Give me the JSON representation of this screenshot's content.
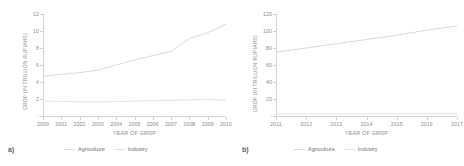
{
  "figure": {
    "panels": [
      {
        "tag": "a)",
        "ylabel": "GRDP (IN TRILLION RUPIAHS)",
        "xlabel": "YEAR OF GRDP",
        "ytick_labels": [
          "12",
          "10",
          "8",
          "6",
          "4",
          "2",
          "-"
        ],
        "xtick_labels": [
          "2000",
          "2001",
          "2002",
          "2003",
          "2004",
          "2005",
          "2006",
          "2007",
          "2008",
          "2009",
          "2010"
        ],
        "legend": [
          {
            "label": "Agriculture",
            "color": "#d9d9d9"
          },
          {
            "label": "Industry",
            "color": "#e3e3e3"
          }
        ]
      },
      {
        "tag": "b)",
        "ylabel": "GRDP (IN TRILLION RUPIAHS)",
        "xlabel": "YEAR OF GRDP",
        "ytick_labels": [
          "120",
          "100",
          "80",
          "60",
          "40",
          "20",
          "-"
        ],
        "xtick_labels": [
          "2011",
          "2012",
          "2013",
          "2014",
          "2015",
          "2016",
          "2017"
        ],
        "legend": [
          {
            "label": "Agriculture",
            "color": "#d9d9d9"
          },
          {
            "label": "Industry",
            "color": "#e3e3e3"
          }
        ]
      }
    ]
  },
  "chart_data": [
    {
      "type": "line",
      "title": "",
      "panel_tag": "a)",
      "xlabel": "YEAR OF GRDP",
      "ylabel": "GRDP (IN TRILLION RUPIAHS)",
      "x": [
        2000,
        2001,
        2002,
        2003,
        2004,
        2005,
        2006,
        2007,
        2008,
        2009,
        2010
      ],
      "xlim": [
        2000,
        2010
      ],
      "ylim": [
        0,
        12
      ],
      "yticks": [
        0,
        2,
        4,
        6,
        8,
        10,
        12
      ],
      "grid": false,
      "legend_position": "bottom",
      "series": [
        {
          "name": "Agriculture",
          "color": "#d9d9d9",
          "values": [
            4.7,
            4.9,
            5.1,
            5.4,
            6.0,
            6.6,
            7.1,
            7.6,
            9.1,
            9.8,
            10.8
          ]
        },
        {
          "name": "Industry",
          "color": "#e3e3e3",
          "values": [
            1.75,
            1.72,
            1.68,
            1.65,
            1.7,
            1.75,
            1.8,
            1.85,
            1.9,
            1.95,
            1.85
          ]
        }
      ]
    },
    {
      "type": "line",
      "title": "",
      "panel_tag": "b)",
      "xlabel": "YEAR OF GRDP",
      "ylabel": "GRDP (IN TRILLION RUPIAHS)",
      "x": [
        2011,
        2012,
        2013,
        2014,
        2015,
        2016,
        2017
      ],
      "xlim": [
        2011,
        2017
      ],
      "ylim": [
        0,
        120
      ],
      "yticks": [
        0,
        20,
        40,
        60,
        80,
        100,
        120
      ],
      "grid": false,
      "legend_position": "bottom",
      "series": [
        {
          "name": "Agriculture",
          "color": "#d9d9d9",
          "values": [
            75,
            80,
            85,
            90,
            95,
            101,
            106
          ]
        },
        {
          "name": "Industry",
          "color": "#e3e3e3",
          "values": [
            2.5,
            2.5,
            2.5,
            2.6,
            2.6,
            2.7,
            2.8
          ]
        }
      ]
    }
  ]
}
